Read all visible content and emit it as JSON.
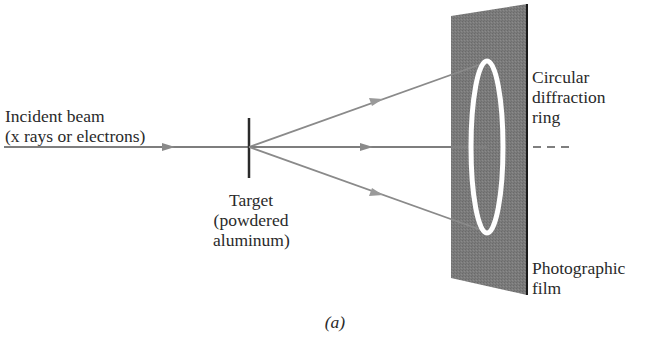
{
  "labels": {
    "incident_line1": "Incident beam",
    "incident_line2": "(x rays or electrons)",
    "target_line1": "Target",
    "target_line2": "(powdered",
    "target_line3": "aluminum)",
    "ring_line1": "Circular",
    "ring_line2": "diffraction",
    "ring_line3": "ring",
    "film_line1": "Photographic",
    "film_line2": "film",
    "caption": "(a)"
  },
  "colors": {
    "film": "#7a7a7a",
    "film_edge": "#1a1a1a",
    "beam": "#808080",
    "ring": "#ffffff",
    "text": "#2a2a2a"
  }
}
